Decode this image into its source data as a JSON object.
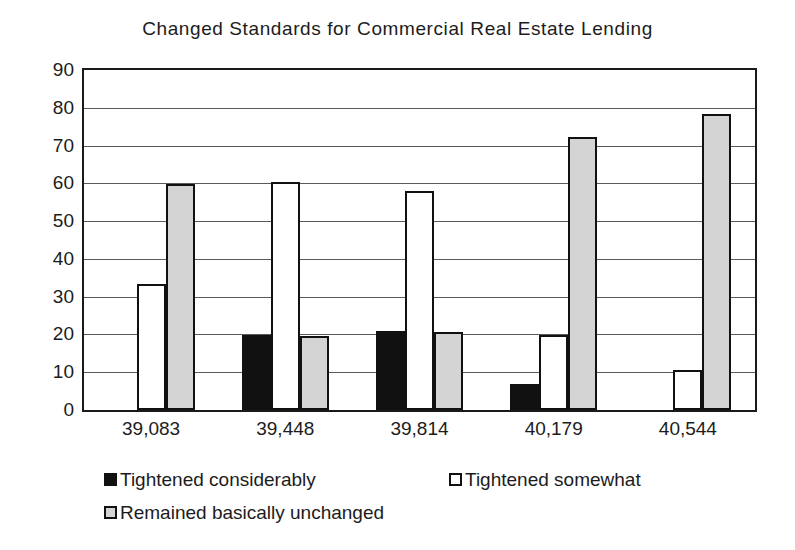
{
  "chart_data": {
    "type": "bar",
    "title": "Changed Standards for Commercial Real Estate Lending",
    "xlabel": "",
    "ylabel": "",
    "ylim": [
      0,
      90
    ],
    "yticks": [
      0,
      10,
      20,
      30,
      40,
      50,
      60,
      70,
      80,
      90
    ],
    "grid": true,
    "legend_position": "bottom",
    "categories": [
      "39,083",
      "39,448",
      "39,814",
      "40,179",
      "40,544"
    ],
    "series": [
      {
        "name": "Tightened considerably",
        "color": "#111111",
        "values": [
          0,
          19.8,
          21,
          7,
          0
        ]
      },
      {
        "name": "Tightened somewhat",
        "color": "#ffffff",
        "values": [
          33.4,
          60.4,
          58,
          19.8,
          10.5
        ]
      },
      {
        "name": "Remained basically unchanged",
        "color": "#d4d4d4",
        "values": [
          59.8,
          19.6,
          20.6,
          72.2,
          78.3
        ]
      }
    ]
  }
}
